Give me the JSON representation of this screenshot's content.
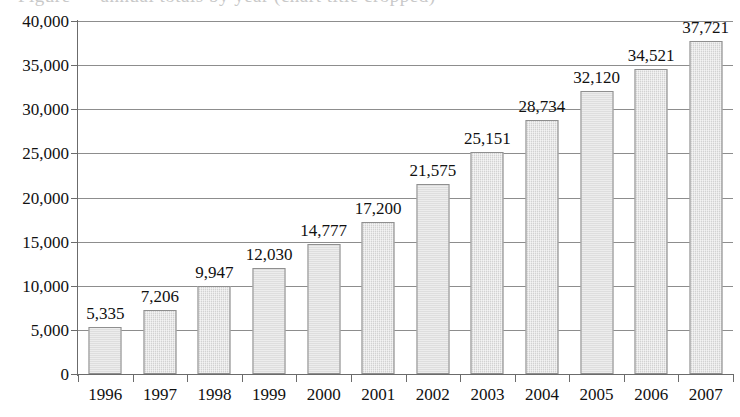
{
  "chart_data": {
    "type": "bar",
    "title": "",
    "xlabel": "",
    "ylabel": "",
    "categories": [
      "1996",
      "1997",
      "1998",
      "1999",
      "2000",
      "2001",
      "2002",
      "2003",
      "2004",
      "2005",
      "2006",
      "2007"
    ],
    "values": [
      5335,
      7206,
      9947,
      12030,
      14777,
      17200,
      21575,
      25151,
      28734,
      32120,
      34521,
      37721
    ],
    "value_labels": [
      "5,335",
      "7,206",
      "9,947",
      "12,030",
      "14,777",
      "17,200",
      "21,575",
      "25,151",
      "28,734",
      "32,120",
      "34,521",
      "37,721"
    ],
    "ylim": [
      0,
      40000
    ],
    "ytick_values": [
      0,
      5000,
      10000,
      15000,
      20000,
      25000,
      30000,
      35000,
      40000
    ],
    "ytick_labels": [
      "0",
      "5,000",
      "10,000",
      "15,000",
      "20,000",
      "25,000",
      "30,000",
      "35,000",
      "40,000"
    ],
    "grid": true,
    "legend": "none",
    "bar_fill_color": "#d2d2d2",
    "bar_border_color": "#8f8f8f",
    "gridline_color": "#8d8d8d",
    "axis_color": "#6b6b6b",
    "text_color": "#111111"
  },
  "clipped_title": "Figure — annual totals by year (chart title cropped)"
}
